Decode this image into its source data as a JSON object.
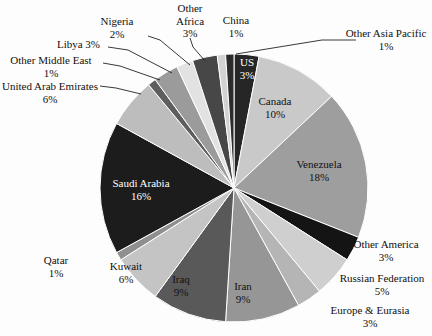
{
  "chart_data": {
    "type": "pie",
    "title": "",
    "units": "percent",
    "legend": "none",
    "labels_inside_and_outside": true,
    "categories": [
      "US",
      "Canada",
      "Venezuela",
      "Other America",
      "Russian Federation",
      "Europe & Eurasia",
      "Iran",
      "Iraq",
      "Kuwait",
      "Qatar",
      "Saudi Arabia",
      "United Arab Emirates",
      "Other Middle East",
      "Libya",
      "Nigeria",
      "Other Africa",
      "China",
      "Other Asia Pacific"
    ],
    "values": [
      3,
      10,
      18,
      3,
      5,
      3,
      9,
      9,
      6,
      1,
      16,
      6,
      1,
      3,
      2,
      3,
      1,
      1
    ],
    "colors": [
      "#262626",
      "#c9c9c9",
      "#9e9e9e",
      "#141414",
      "#cfcfcf",
      "#b5b5b5",
      "#969696",
      "#595959",
      "#c4c4c4",
      "#8f8f8f",
      "#1c1c1c",
      "#bdbdbd",
      "#5e5e5e",
      "#9b9b9b",
      "#e2e2e2",
      "#474747",
      "#d2d2d2",
      "#2b2b2b"
    ],
    "slices": [
      {
        "name": "US",
        "value": 3,
        "label": "US",
        "percent": "3%",
        "color": "#262626",
        "label_placement": "inside",
        "label_color": "white"
      },
      {
        "name": "Canada",
        "value": 10,
        "label": "Canada",
        "percent": "10%",
        "color": "#c9c9c9",
        "label_placement": "inside",
        "label_color": "dark"
      },
      {
        "name": "Venezuela",
        "value": 18,
        "label": "Venezuela",
        "percent": "18%",
        "color": "#9e9e9e",
        "label_placement": "inside",
        "label_color": "dark"
      },
      {
        "name": "Other America",
        "value": 3,
        "label": "Other America",
        "percent": "3%",
        "color": "#141414",
        "label_placement": "outside",
        "label_color": "dark"
      },
      {
        "name": "Russian Federation",
        "value": 5,
        "label": "Russian Federation",
        "percent": "5%",
        "color": "#cfcfcf",
        "label_placement": "outside",
        "label_color": "dark"
      },
      {
        "name": "Europe & Eurasia",
        "value": 3,
        "label": "Europe & Eurasia",
        "percent": "3%",
        "color": "#b5b5b5",
        "label_placement": "outside",
        "label_color": "dark"
      },
      {
        "name": "Iran",
        "value": 9,
        "label": "Iran",
        "percent": "9%",
        "color": "#969696",
        "label_placement": "inside",
        "label_color": "dark"
      },
      {
        "name": "Iraq",
        "value": 9,
        "label": "Iraq",
        "percent": "9%",
        "color": "#595959",
        "label_placement": "inside",
        "label_color": "dark"
      },
      {
        "name": "Kuwait",
        "value": 6,
        "label": "Kuwait",
        "percent": "6%",
        "color": "#c4c4c4",
        "label_placement": "inside",
        "label_color": "dark"
      },
      {
        "name": "Qatar",
        "value": 1,
        "label": "Qatar",
        "percent": "1%",
        "color": "#8f8f8f",
        "label_placement": "outside",
        "label_color": "dark"
      },
      {
        "name": "Saudi Arabia",
        "value": 16,
        "label": "Saudi Arabia",
        "percent": "16%",
        "color": "#1c1c1c",
        "label_placement": "inside",
        "label_color": "white"
      },
      {
        "name": "United Arab Emirates",
        "value": 6,
        "label": "United Arab Emirates",
        "percent": "6%",
        "color": "#bdbdbd",
        "label_placement": "outside-leader",
        "label_color": "dark"
      },
      {
        "name": "Other Middle East",
        "value": 1,
        "label": "Other Middle East",
        "percent": "1%",
        "color": "#5e5e5e",
        "label_placement": "outside-leader",
        "label_color": "dark"
      },
      {
        "name": "Libya",
        "value": 3,
        "label": "Libya",
        "percent": "3%",
        "color": "#9b9b9b",
        "label_placement": "outside-leader",
        "label_color": "dark"
      },
      {
        "name": "Nigeria",
        "value": 2,
        "label": "Nigeria",
        "percent": "2%",
        "color": "#e2e2e2",
        "label_placement": "outside-leader",
        "label_color": "dark"
      },
      {
        "name": "Other Africa",
        "value": 3,
        "label": "Other Africa",
        "percent": "3%",
        "color": "#474747",
        "label_placement": "outside-leader",
        "label_color": "dark"
      },
      {
        "name": "China",
        "value": 1,
        "label": "China",
        "percent": "1%",
        "color": "#d2d2d2",
        "label_placement": "outside",
        "label_color": "dark"
      },
      {
        "name": "Other Asia Pacific",
        "value": 1,
        "label": "Other Asia Pacific",
        "percent": "1%",
        "color": "#2b2b2b",
        "label_placement": "outside-leader",
        "label_color": "dark"
      }
    ]
  },
  "labels": {
    "nigeria": {
      "name": "Nigeria",
      "percent": "2%"
    },
    "other_africa": {
      "name": "Other",
      "name2": "Africa",
      "percent": "3%"
    },
    "china": {
      "name": "China",
      "percent": "1%"
    },
    "other_asia_pacific": {
      "name": "Other Asia Pacific",
      "percent": "1%"
    },
    "libya": {
      "name": "Libya 3%"
    },
    "other_middle_east": {
      "name": "Other Middle East",
      "percent": "1%"
    },
    "uae": {
      "name": "United Arab Emirates",
      "percent": "6%"
    },
    "us": {
      "name": "US",
      "percent": "3%"
    },
    "canada": {
      "name": "Canada",
      "percent": "10%"
    },
    "venezuela": {
      "name": "Venezuela",
      "percent": "18%"
    },
    "other_america": {
      "name": "Other America",
      "percent": "3%"
    },
    "russian_federation": {
      "name": "Russian Federation",
      "percent": "5%"
    },
    "europe_eurasia": {
      "name": "Europe & Eurasia",
      "percent": "3%"
    },
    "iran": {
      "name": "Iran",
      "percent": "9%"
    },
    "iraq": {
      "name": "Iraq",
      "percent": "9%"
    },
    "kuwait": {
      "name": "Kuwait",
      "percent": "6%"
    },
    "qatar": {
      "name": "Qatar",
      "percent": "1%"
    },
    "saudi_arabia": {
      "name": "Saudi Arabia",
      "percent": "16%"
    }
  },
  "geometry": {
    "center_x": 234,
    "center_y": 188,
    "radius": 134,
    "start_angle_deg": -90,
    "direction": "clockwise"
  },
  "style": {
    "background": "#fdfdfd",
    "text_color": "#101010",
    "leader_line_color": "#222222"
  }
}
